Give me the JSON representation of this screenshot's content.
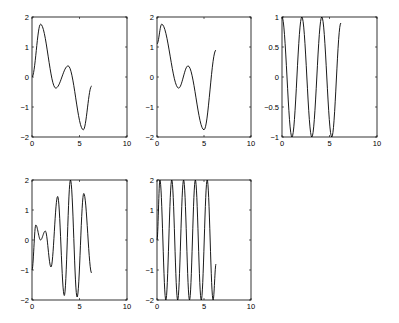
{
  "figure": {
    "rows": 2,
    "cols": 3,
    "subplots_shown": 5
  },
  "chart_data": [
    {
      "type": "line",
      "title": "",
      "xlabel": "",
      "ylabel": "",
      "xlim": [
        0,
        10
      ],
      "ylim": [
        -2,
        2
      ],
      "xticks": [
        "0",
        "5",
        "10"
      ],
      "yticks": [
        "-2",
        "-1",
        "0",
        "1",
        "2"
      ],
      "grid": false,
      "series": [
        {
          "name": "y1",
          "formula": "sin(x)+sin(2x)",
          "x_range": [
            0,
            6.28
          ],
          "points": [
            [
              0,
              0
            ],
            [
              0.9,
              1.76
            ],
            [
              2.5,
              -0.37
            ],
            [
              3.8,
              0.37
            ],
            [
              5.4,
              -1.76
            ],
            [
              6.28,
              -0.3
            ]
          ]
        }
      ]
    },
    {
      "type": "line",
      "title": "",
      "xlabel": "",
      "ylabel": "",
      "xlim": [
        0,
        10
      ],
      "ylim": [
        -2,
        2
      ],
      "xticks": [
        "0",
        "5",
        "10"
      ],
      "yticks": [
        "-2",
        "-1",
        "0",
        "1",
        "2"
      ],
      "grid": false,
      "series": [
        {
          "name": "y2",
          "formula": "sin(x+0.5)+sin(2x+0.5)",
          "x_range": [
            0,
            6.28
          ],
          "points": [
            [
              0,
              1.1
            ],
            [
              0.5,
              1.76
            ],
            [
              2.3,
              -0.37
            ],
            [
              3.3,
              0.37
            ],
            [
              5.0,
              -1.76
            ],
            [
              6.28,
              0.9
            ]
          ]
        }
      ]
    },
    {
      "type": "line",
      "title": "",
      "xlabel": "",
      "ylabel": "",
      "xlim": [
        0,
        10
      ],
      "ylim": [
        -1,
        1
      ],
      "xticks": [
        "0",
        "5",
        "10"
      ],
      "yticks": [
        "-1",
        "-0.5",
        "0",
        "0.5",
        "1"
      ],
      "grid": false,
      "series": [
        {
          "name": "y3",
          "formula": "cos(3x)",
          "x_range": [
            0,
            6.28
          ],
          "points": [
            [
              0,
              1
            ],
            [
              1.05,
              -1
            ],
            [
              2.09,
              1
            ],
            [
              3.14,
              -1
            ],
            [
              4.19,
              1
            ],
            [
              5.24,
              -1
            ],
            [
              6.2,
              0.9
            ]
          ]
        }
      ]
    },
    {
      "type": "line",
      "title": "",
      "xlabel": "",
      "ylabel": "",
      "xlim": [
        0,
        10
      ],
      "ylim": [
        -2,
        2
      ],
      "xticks": [
        "0",
        "5",
        "10"
      ],
      "yticks": [
        "-2",
        "-1",
        "0",
        "1",
        "2"
      ],
      "grid": false,
      "series": [
        {
          "name": "y4",
          "formula": "chirp-like",
          "x_range": [
            0,
            6.28
          ],
          "points": [
            [
              0,
              -1
            ],
            [
              0.4,
              0.5
            ],
            [
              0.9,
              0
            ],
            [
              1.4,
              0.3
            ],
            [
              2.0,
              -0.9
            ],
            [
              2.7,
              1.45
            ],
            [
              3.4,
              -1.85
            ],
            [
              4.05,
              2.0
            ],
            [
              4.75,
              -1.9
            ],
            [
              5.45,
              1.55
            ],
            [
              6.28,
              -1.1
            ]
          ]
        }
      ]
    },
    {
      "type": "line",
      "title": "",
      "xlabel": "",
      "ylabel": "",
      "xlim": [
        0,
        10
      ],
      "ylim": [
        -2,
        2
      ],
      "xticks": [
        "0",
        "5",
        "10"
      ],
      "yticks": [
        "-2",
        "-1",
        "0",
        "1",
        "2"
      ],
      "grid": false,
      "series": [
        {
          "name": "y5",
          "formula": "2sin(5x)",
          "x_range": [
            0,
            6.28
          ],
          "points": [
            [
              0,
              0
            ],
            [
              0.31,
              2
            ],
            [
              0.94,
              -2
            ],
            [
              1.57,
              2
            ],
            [
              2.2,
              -2
            ],
            [
              2.83,
              2
            ],
            [
              3.46,
              -2
            ],
            [
              4.08,
              2
            ],
            [
              4.71,
              -2
            ],
            [
              5.34,
              2
            ],
            [
              5.97,
              -2
            ],
            [
              6.28,
              -0.8
            ]
          ]
        }
      ]
    }
  ],
  "layout": {
    "boxes": [
      {
        "x": 32,
        "y": 17,
        "w": 95,
        "h": 120
      },
      {
        "x": 157,
        "y": 17,
        "w": 94,
        "h": 120
      },
      {
        "x": 282,
        "y": 17,
        "w": 95,
        "h": 120
      },
      {
        "x": 32,
        "y": 180,
        "w": 95,
        "h": 120
      },
      {
        "x": 157,
        "y": 180,
        "w": 94,
        "h": 120
      }
    ]
  }
}
